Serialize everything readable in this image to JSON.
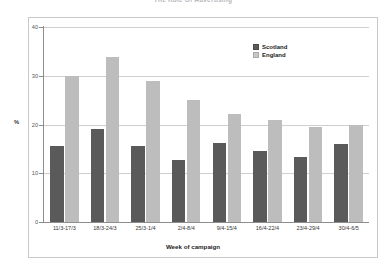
{
  "chart_data": {
    "type": "bar",
    "title": "The Role Of Advertising",
    "xlabel": "Week of campaign",
    "ylabel": "%",
    "ylim": [
      0,
      40
    ],
    "yticks": [
      0,
      10,
      20,
      30,
      40
    ],
    "grid": true,
    "legend_position": "top-right",
    "categories": [
      "11/3-17/3",
      "18/3-24/3",
      "25/3-1/4",
      "2/4-8/4",
      "9/4-15/4",
      "16/4-22/4",
      "23/4-29/4",
      "30/4-6/5"
    ],
    "series": [
      {
        "name": "Scotland",
        "color": "#5a5a5a",
        "values": [
          15.5,
          19.0,
          15.5,
          12.8,
          16.3,
          14.6,
          13.3,
          16.0
        ]
      },
      {
        "name": "England",
        "color": "#bdbdbd",
        "values": [
          30.0,
          33.8,
          29.0,
          25.0,
          22.2,
          21.0,
          19.4,
          19.8
        ]
      }
    ]
  }
}
